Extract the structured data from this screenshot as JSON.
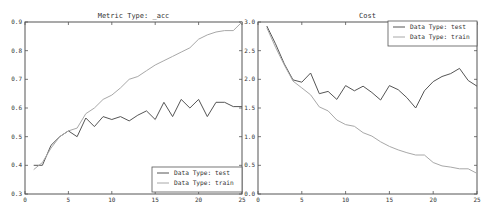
{
  "chart_data": [
    {
      "type": "line",
      "title": "Metric Type: _acc",
      "xlabel": "",
      "ylabel": "",
      "xlim": [
        0,
        25
      ],
      "ylim": [
        0.3,
        0.9
      ],
      "xticks": [
        0,
        5,
        10,
        15,
        20,
        25
      ],
      "yticks": [
        0.3,
        0.4,
        0.5,
        0.6,
        0.7,
        0.8,
        0.9
      ],
      "ytick_labels": [
        "0.3",
        "0.4",
        "0.5",
        "0.6",
        "0.7",
        "0.8",
        "0.9"
      ],
      "grid": false,
      "legend_position": "lower right",
      "x": [
        1,
        2,
        3,
        4,
        5,
        6,
        7,
        8,
        9,
        10,
        11,
        12,
        13,
        14,
        15,
        16,
        17,
        18,
        19,
        20,
        21,
        22,
        23,
        24,
        25
      ],
      "series": [
        {
          "name": "Data Type: test",
          "color": "#555555",
          "values": [
            0.4,
            0.4,
            0.47,
            0.5,
            0.52,
            0.5,
            0.565,
            0.535,
            0.57,
            0.56,
            0.57,
            0.555,
            0.575,
            0.59,
            0.56,
            0.62,
            0.57,
            0.63,
            0.6,
            0.63,
            0.57,
            0.62,
            0.62,
            0.605,
            0.605
          ]
        },
        {
          "name": "Data Type: train",
          "color": "#a8a8a8",
          "values": [
            0.385,
            0.41,
            0.46,
            0.5,
            0.52,
            0.53,
            0.58,
            0.6,
            0.63,
            0.645,
            0.67,
            0.7,
            0.71,
            0.73,
            0.75,
            0.765,
            0.78,
            0.795,
            0.81,
            0.84,
            0.855,
            0.865,
            0.87,
            0.87,
            0.9
          ]
        }
      ]
    },
    {
      "type": "line",
      "title": "Cost",
      "xlabel": "",
      "ylabel": "",
      "xlim": [
        0,
        25
      ],
      "ylim": [
        0.0,
        3.0
      ],
      "xticks": [
        0,
        5,
        10,
        15,
        20,
        25
      ],
      "yticks": [
        0.0,
        0.5,
        1.0,
        1.5,
        2.0,
        2.5,
        3.0
      ],
      "ytick_labels": [
        "0.0",
        "0.5",
        "1.0",
        "1.5",
        "2.0",
        "2.5",
        "3.0"
      ],
      "grid": false,
      "legend_position": "upper right",
      "x": [
        1,
        2,
        3,
        4,
        5,
        6,
        7,
        8,
        9,
        10,
        11,
        12,
        13,
        14,
        15,
        16,
        17,
        18,
        19,
        20,
        21,
        22,
        23,
        24,
        25
      ],
      "series": [
        {
          "name": "Data Type: test",
          "color": "#555555",
          "values": [
            2.93,
            2.62,
            2.27,
            1.99,
            1.95,
            2.11,
            1.75,
            1.79,
            1.65,
            1.89,
            1.8,
            1.88,
            1.77,
            1.64,
            1.89,
            1.82,
            1.68,
            1.5,
            1.8,
            1.96,
            2.05,
            2.1,
            2.19,
            1.98,
            1.88
          ]
        },
        {
          "name": "Data Type: train",
          "color": "#a8a8a8",
          "values": [
            2.9,
            2.56,
            2.25,
            1.97,
            1.85,
            1.73,
            1.52,
            1.45,
            1.29,
            1.21,
            1.18,
            1.07,
            1.01,
            0.91,
            0.83,
            0.77,
            0.72,
            0.68,
            0.68,
            0.55,
            0.49,
            0.47,
            0.44,
            0.44,
            0.36
          ]
        }
      ]
    }
  ]
}
